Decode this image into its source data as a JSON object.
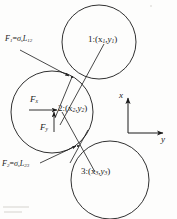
{
  "figure": {
    "background_color": "#fdfdfc",
    "stroke_color": "#1a1a1a"
  },
  "circles": [
    {
      "id": "1",
      "label": "1:(x",
      "label_sub1": "1",
      "label_mid": ",y",
      "label_sub2": "1",
      "label_end": ")",
      "cx": 99,
      "cy": 42,
      "r": 37
    },
    {
      "id": "2",
      "label": "2:(x",
      "label_sub1": "2",
      "label_mid": ",y",
      "label_sub2": "2",
      "label_end": ")",
      "cx": 52,
      "cy": 112,
      "r": 41
    },
    {
      "id": "3",
      "label": "3:(x",
      "label_sub1": "3",
      "label_mid": ",y",
      "label_sub2": "3",
      "label_end": ")",
      "cx": 110,
      "cy": 180,
      "r": 39
    }
  ],
  "labels": {
    "circle1": {
      "text": "1:(x",
      "s1": "1",
      "mid": ",y",
      "s2": "1",
      "end": ")",
      "x": 88,
      "y": 40
    },
    "circle2": {
      "text": "2:(x",
      "s1": "2",
      "mid": ",y",
      "s2": "2",
      "end": ")",
      "x": 59,
      "y": 106
    },
    "circle3": {
      "text": "3:(x",
      "s1": "3",
      "mid": ",y",
      "s2": "3",
      "end": ")",
      "x": 82,
      "y": 169
    },
    "force1": {
      "f": "F",
      "f_sub": "1",
      "eq": "=",
      "sigma": "σ",
      "sigma_sub": "s",
      "L": "L",
      "L_sub": "12",
      "x": 6,
      "y": 38
    },
    "force2": {
      "f": "F",
      "f_sub": "2",
      "eq": "=",
      "sigma": "σ",
      "sigma_sub": "s",
      "L": "L",
      "L_sub": "23",
      "x": 2,
      "y": 163
    },
    "fx": {
      "f": "F",
      "sub": "x",
      "x": 30,
      "y": 98
    },
    "fy": {
      "f": "F",
      "sub": "y",
      "x": 40,
      "y": 126
    },
    "axis_x": {
      "text": "x",
      "x": 120,
      "y": 93
    },
    "axis_y": {
      "text": "y",
      "x": 162,
      "y": 138
    }
  },
  "axes": {
    "origin_x": 128,
    "origin_y": 133,
    "x_tip_y": 97,
    "y_tip_x": 164,
    "x_axis_name": "x",
    "y_axis_name": "y"
  },
  "contacts": [
    {
      "name": "contact-1-2",
      "x": 72,
      "y": 77
    },
    {
      "name": "contact-2-3",
      "x": 78,
      "y": 146
    }
  ]
}
